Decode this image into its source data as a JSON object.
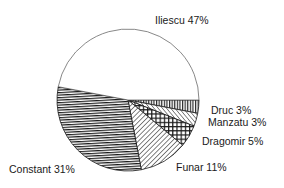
{
  "chart_data": {
    "type": "pie",
    "title": "",
    "start_angle_deg": 0,
    "direction": "clockwise-from-druc",
    "slices": [
      {
        "name": "Iliescu",
        "value": 47,
        "label": "Iliescu 47%",
        "pattern": "none"
      },
      {
        "name": "Druc",
        "value": 3,
        "label": "Druc 3%",
        "pattern": "vertical-lines"
      },
      {
        "name": "Manzatu",
        "value": 3,
        "label": "Manzatu 3%",
        "pattern": "diagonal-lines"
      },
      {
        "name": "Dragomir",
        "value": 5,
        "label": "Dragomir 5%",
        "pattern": "crosshatch"
      },
      {
        "name": "Funar",
        "value": 11,
        "label": "Funar 11%",
        "pattern": "diagonal-lines-back"
      },
      {
        "name": "Constant",
        "value": 31,
        "label": "Constant 31%",
        "pattern": "horizontal-lines"
      }
    ],
    "categories": [
      "Iliescu",
      "Druc",
      "Manzatu",
      "Dragomir",
      "Funar",
      "Constant"
    ],
    "values": [
      47,
      3,
      3,
      5,
      11,
      31
    ],
    "legend": "none (direct labels)",
    "colors": {
      "stroke": "#333333",
      "fill": "#ffffff",
      "hatch": "#1a1a1a"
    }
  },
  "labels": {
    "iliescu": "Iliescu 47%",
    "druc": "Druc 3%",
    "manzatu": "Manzatu 3%",
    "dragomir": "Dragomir 5%",
    "funar": "Funar 11%",
    "constant": "Constant 31%"
  }
}
